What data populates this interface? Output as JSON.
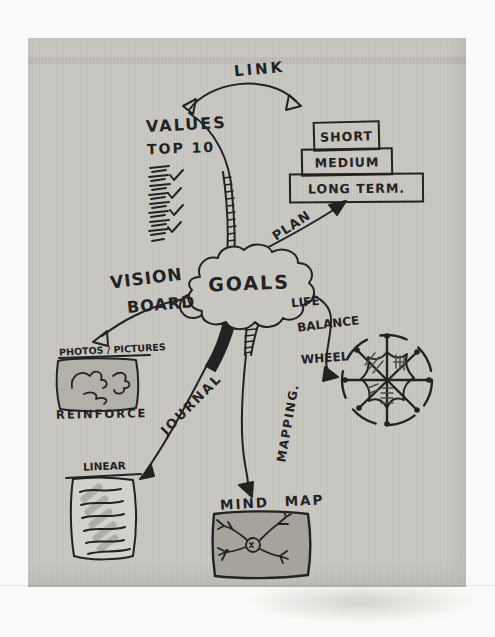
{
  "palette": {
    "paper": "#c9c7c2",
    "ink": "#222222",
    "margin": "#fbfaf8",
    "photos_board_fill": "#b3b0aa",
    "mind_map_box_fill": "#a6a39d",
    "linear_page_fill": "#d3d1cc"
  },
  "center": {
    "goals_label": "GOALS"
  },
  "link_arrow": {
    "label": "LINK"
  },
  "values_branch": {
    "title": "VALUES",
    "subtitle": "TOP 10"
  },
  "term_stack": {
    "levels": [
      "SHORT",
      "MEDIUM",
      "LONG TERM."
    ]
  },
  "plan_branch": {
    "label": "PLAN"
  },
  "vision_branch": {
    "word1": "VISION",
    "word2": "BOARD",
    "caption": "PHOTOS / PICTURES",
    "note": "REINFORCE"
  },
  "wheel_branch": {
    "word1": "LIFE",
    "word2": "BALANCE",
    "word3": "WHEEL"
  },
  "journal_branch": {
    "label": "JOURNAL",
    "page_caption": "LINEAR"
  },
  "mapping_branch": {
    "label": "MAPPING.",
    "box_caption": "MIND MAP"
  }
}
